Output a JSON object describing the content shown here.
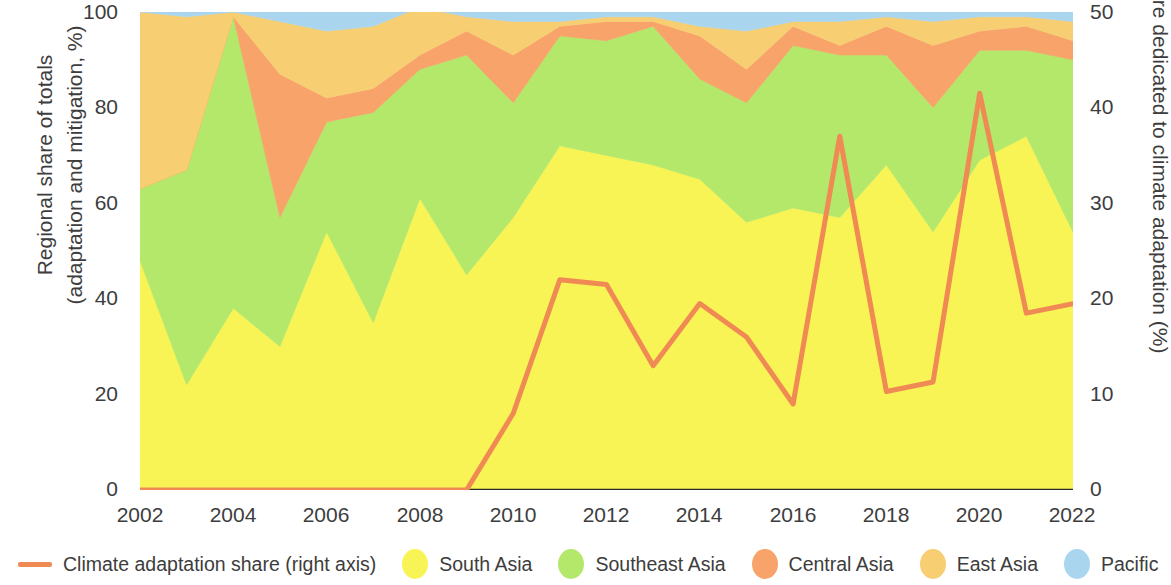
{
  "axes": {
    "left_title": "Regional share of totals\n(adaptation and mitigation, %)",
    "right_title": "Share dedicated to climate adaptation (%)",
    "left_ticks": [
      "100",
      "80",
      "60",
      "40",
      "20",
      "0"
    ],
    "right_ticks": [
      "50",
      "40",
      "30",
      "20",
      "10",
      "0"
    ],
    "x_ticks": [
      "2002",
      "2004",
      "2006",
      "2008",
      "2010",
      "2012",
      "2014",
      "2016",
      "2018",
      "2020",
      "2022"
    ]
  },
  "legend": {
    "items": [
      {
        "label": "Climate adaptation share (right axis)",
        "color": "#F08А54",
        "marker": "line",
        "name": "legend-climate-adaptation-share"
      },
      {
        "label": "South Asia",
        "color": "#F9F455",
        "marker": "dot",
        "name": "legend-south-asia"
      },
      {
        "label": "Southeast Asia",
        "color": "#B4E86B",
        "marker": "dot",
        "name": "legend-southeast-asia"
      },
      {
        "label": "Central Asia",
        "color": "#F7A36A",
        "marker": "dot",
        "name": "legend-central-asia"
      },
      {
        "label": "East Asia",
        "color": "#F7CE72",
        "marker": "dot",
        "name": "legend-east-asia"
      },
      {
        "label": "Pacific",
        "color": "#A9D5EF",
        "marker": "dot",
        "name": "legend-pacific"
      }
    ]
  },
  "chart_data": {
    "type": "area",
    "title": "",
    "xlabel": "",
    "ylabel": "Regional share of totals (adaptation and mitigation, %)",
    "y2label": "Share dedicated to climate adaptation (%)",
    "ylim": [
      0,
      100
    ],
    "y2lim": [
      0,
      50
    ],
    "grid": false,
    "legend_position": "bottom",
    "stacked": true,
    "colors": {
      "south_asia": "#F9F455",
      "southeast_asia": "#B4E86B",
      "central_asia": "#F7A36A",
      "east_asia": "#F7CE72",
      "pacific": "#A9D5EF",
      "climate_line": "#F08A54",
      "axis": "#2b2b2b",
      "text": "#3d3d3d"
    },
    "x": [
      2002,
      2003,
      2004,
      2005,
      2006,
      2007,
      2008,
      2009,
      2010,
      2011,
      2012,
      2013,
      2014,
      2015,
      2016,
      2017,
      2018,
      2019,
      2020,
      2021,
      2022
    ],
    "series": [
      {
        "name": "South Asia",
        "color": "#F9F455",
        "values": [
          48,
          22,
          38,
          30,
          54,
          35,
          61,
          45,
          57,
          72,
          70,
          68,
          65,
          56,
          59,
          57,
          68,
          54,
          69,
          74,
          54
        ]
      },
      {
        "name": "Southeast Asia",
        "color": "#B4E86B",
        "values": [
          15,
          45,
          61,
          27,
          23,
          44,
          27,
          46,
          24,
          23,
          24,
          29,
          21,
          25,
          34,
          34,
          23,
          26,
          23,
          18,
          36
        ]
      },
      {
        "name": "Central Asia",
        "color": "#F7A36A",
        "values": [
          0,
          0,
          0,
          30,
          5,
          5,
          3,
          5,
          10,
          2,
          4,
          1,
          9,
          7,
          4,
          2,
          6,
          13,
          4,
          5,
          4
        ]
      },
      {
        "name": "East Asia",
        "color": "#F7CE72",
        "values": [
          37,
          32,
          1,
          11,
          14,
          13,
          10,
          3,
          7,
          1,
          1,
          1,
          2,
          8,
          1,
          5,
          2,
          5,
          3,
          2,
          4
        ]
      },
      {
        "name": "Pacific",
        "color": "#A9D5EF",
        "values": [
          0,
          1,
          0,
          2,
          4,
          3,
          0,
          1,
          2,
          2,
          1,
          1,
          3,
          4,
          2,
          2,
          1,
          2,
          1,
          1,
          2
        ]
      }
    ],
    "line_series": {
      "name": "Climate adaptation share (right axis)",
      "color": "#F08A54",
      "axis": "right",
      "values": [
        0,
        0,
        0,
        0,
        0,
        0,
        0,
        0,
        8,
        22,
        21.5,
        13,
        19.5,
        16,
        9,
        37,
        10.3,
        11.3,
        41.5,
        18.5,
        19.5
      ]
    }
  }
}
